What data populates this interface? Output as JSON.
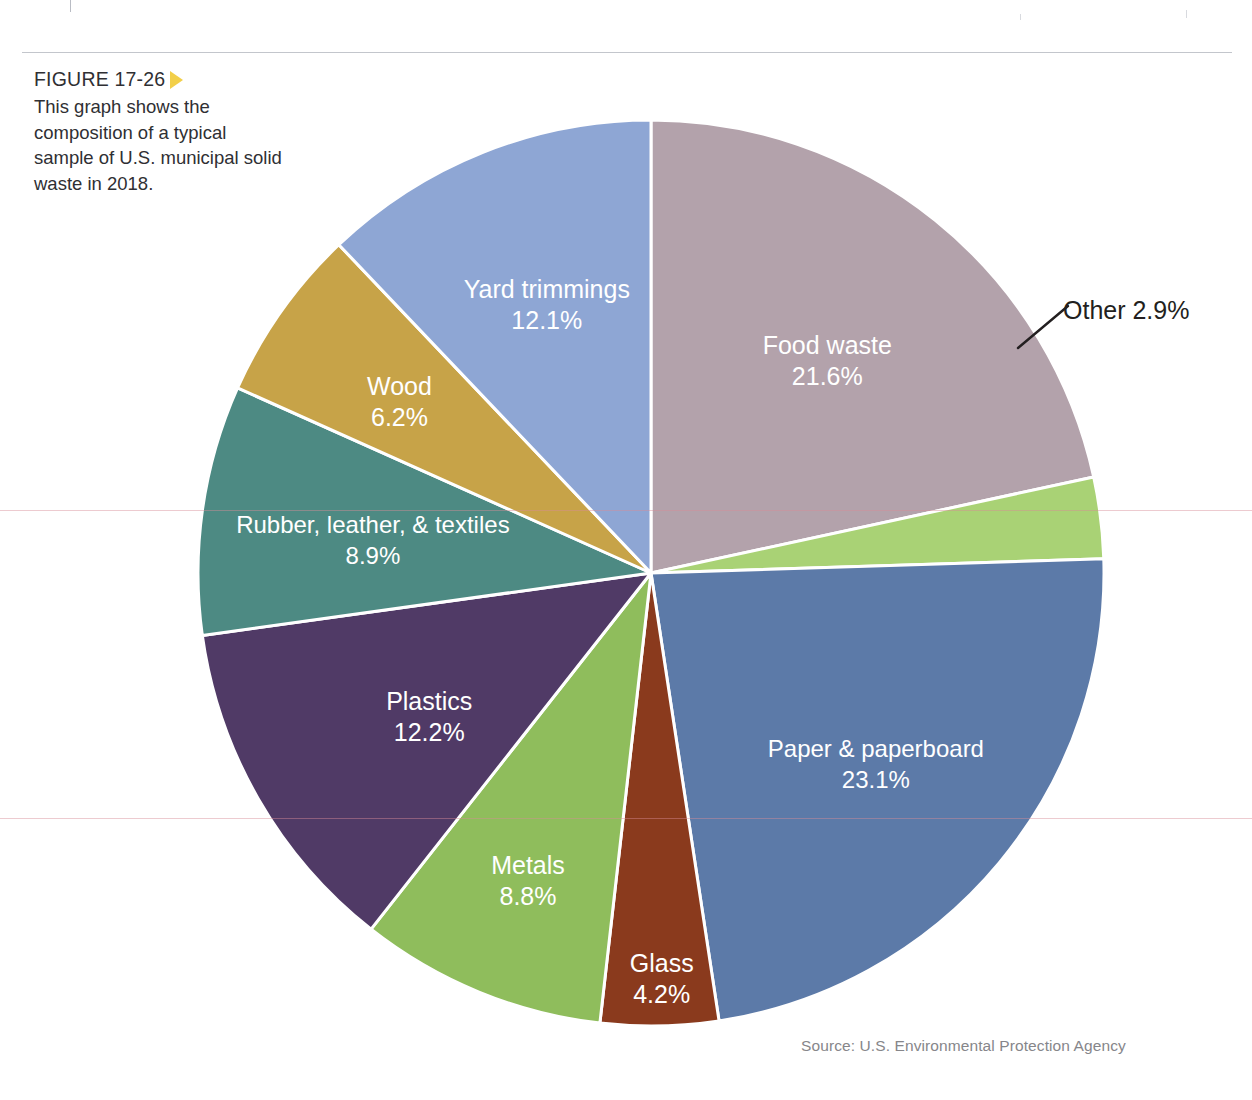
{
  "figure": {
    "label": "FIGURE 17-26",
    "caption": "This graph shows the composition of a typical sample of U.S. municipal solid waste in 2018.",
    "arrow_color": "#f2cf49"
  },
  "source": {
    "text": "Source: U.S. Environmental Protection Agency"
  },
  "callout": {
    "other_label": "Other 2.9%"
  },
  "chart_data": {
    "type": "pie",
    "title": "Composition of a typical sample of U.S. municipal solid waste in 2018",
    "unit": "percent",
    "start_angle_deg": 0,
    "direction": "clockwise",
    "legend": "none (labels drawn inside slices)",
    "total": 100.0,
    "categories": [
      "Food waste",
      "Other",
      "Paper & paperboard",
      "Glass",
      "Metals",
      "Plastics",
      "Rubber, leather, & textiles",
      "Wood",
      "Yard trimmings"
    ],
    "values": [
      21.6,
      2.9,
      23.1,
      4.2,
      8.8,
      12.2,
      8.9,
      6.2,
      12.1
    ],
    "colors": [
      "#b3a2ab",
      "#a9d275",
      "#5c7aa8",
      "#8a3a1d",
      "#8fbd5c",
      "#503a66",
      "#4d8a83",
      "#c7a348",
      "#8ea6d4"
    ],
    "slices": [
      {
        "label": "Food waste",
        "value": 21.6,
        "value_text": "21.6%",
        "color": "#b3a2ab",
        "label_color": "#ffffff",
        "label_placement": "inside"
      },
      {
        "label": "Other",
        "value": 2.9,
        "value_text": "2.9%",
        "color": "#a9d275",
        "label_color": "#231f20",
        "label_placement": "callout"
      },
      {
        "label": "Paper & paperboard",
        "value": 23.1,
        "value_text": "23.1%",
        "color": "#5c7aa8",
        "label_color": "#ffffff",
        "label_placement": "inside"
      },
      {
        "label": "Glass",
        "value": 4.2,
        "value_text": "4.2%",
        "color": "#8a3a1d",
        "label_color": "#ffffff",
        "label_placement": "inside"
      },
      {
        "label": "Metals",
        "value": 8.8,
        "value_text": "8.8%",
        "color": "#8fbd5c",
        "label_color": "#ffffff",
        "label_placement": "inside"
      },
      {
        "label": "Plastics",
        "value": 12.2,
        "value_text": "12.2%",
        "color": "#503a66",
        "label_color": "#ffffff",
        "label_placement": "inside"
      },
      {
        "label": "Rubber, leather, & textiles",
        "value": 8.9,
        "value_text": "8.9%",
        "color": "#4d8a83",
        "label_color": "#ffffff",
        "label_placement": "inside"
      },
      {
        "label": "Wood",
        "value": 6.2,
        "value_text": "6.2%",
        "color": "#c7a348",
        "label_color": "#ffffff",
        "label_placement": "inside"
      },
      {
        "label": "Yard trimmings",
        "value": 12.1,
        "value_text": "12.1%",
        "color": "#8ea6d4",
        "label_color": "#ffffff",
        "label_placement": "inside"
      }
    ]
  }
}
